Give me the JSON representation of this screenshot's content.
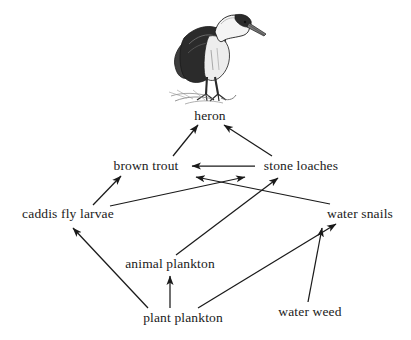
{
  "diagram": {
    "type": "food-web",
    "background_color": "#ffffff",
    "line_color": "#1a1a1a",
    "text_color": "#1a1a1a",
    "illustration": {
      "name": "heron-illustration",
      "subject": "heron",
      "body_color": "#4a4a4a",
      "wing_color": "#2b2b2b",
      "neck_color": "#f2f2f2",
      "outline_color": "#1c1c1c",
      "beak_color": "#6b6b6b"
    },
    "nodes": [
      {
        "id": "heron",
        "label": "heron",
        "x": 210,
        "y": 116
      },
      {
        "id": "brown_trout",
        "label": "brown trout",
        "x": 146,
        "y": 166
      },
      {
        "id": "stone_loaches",
        "label": "stone loaches",
        "x": 301,
        "y": 166
      },
      {
        "id": "caddis_fly_larvae",
        "label": "caddis fly larvae",
        "x": 68,
        "y": 214
      },
      {
        "id": "water_snails",
        "label": "water snails",
        "x": 360,
        "y": 214
      },
      {
        "id": "animal_plankton",
        "label": "animal plankton",
        "x": 170,
        "y": 264
      },
      {
        "id": "plant_plankton",
        "label": "plant plankton",
        "x": 183,
        "y": 318
      },
      {
        "id": "water_weed",
        "label": "water weed",
        "x": 310,
        "y": 312
      }
    ],
    "edges": [
      {
        "from": "brown_trout",
        "to": "heron",
        "label": "brown trout eaten by heron",
        "x1": 173,
        "y1": 156,
        "x2": 198,
        "y2": 125
      },
      {
        "from": "stone_loaches",
        "to": "heron",
        "label": "stone loaches eaten by heron",
        "x1": 272,
        "y1": 156,
        "x2": 224,
        "y2": 125
      },
      {
        "from": "stone_loaches",
        "to": "brown_trout",
        "label": "stone loaches eaten by brown trout",
        "x1": 255,
        "y1": 166,
        "x2": 192,
        "y2": 166
      },
      {
        "from": "caddis_fly_larvae",
        "to": "brown_trout",
        "label": "caddis fly larvae eaten by brown trout",
        "x1": 93,
        "y1": 205,
        "x2": 121,
        "y2": 176
      },
      {
        "from": "caddis_fly_larvae",
        "to": "stone_loaches",
        "label": "caddis fly larvae eaten by stone loaches",
        "x1": 110,
        "y1": 206,
        "x2": 245,
        "y2": 177
      },
      {
        "from": "water_snails",
        "to": "brown_trout",
        "label": "water snails eaten by brown trout",
        "x1": 330,
        "y1": 204,
        "x2": 196,
        "y2": 177
      },
      {
        "from": "animal_plankton",
        "to": "stone_loaches",
        "label": "animal plankton eaten by stone loaches",
        "x1": 176,
        "y1": 255,
        "x2": 278,
        "y2": 178
      },
      {
        "from": "plant_plankton",
        "to": "caddis_fly_larvae",
        "label": "plant plankton eaten by caddis fly larvae",
        "x1": 148,
        "y1": 308,
        "x2": 73,
        "y2": 228
      },
      {
        "from": "plant_plankton",
        "to": "animal_plankton",
        "label": "plant plankton eaten by animal plankton",
        "x1": 170,
        "y1": 308,
        "x2": 170,
        "y2": 276
      },
      {
        "from": "plant_plankton",
        "to": "water_snails",
        "label": "plant plankton eaten by water snails",
        "x1": 198,
        "y1": 308,
        "x2": 336,
        "y2": 224
      },
      {
        "from": "water_weed",
        "to": "water_snails",
        "label": "water weed eaten by water snails",
        "x1": 308,
        "y1": 302,
        "x2": 322,
        "y2": 228
      }
    ]
  }
}
